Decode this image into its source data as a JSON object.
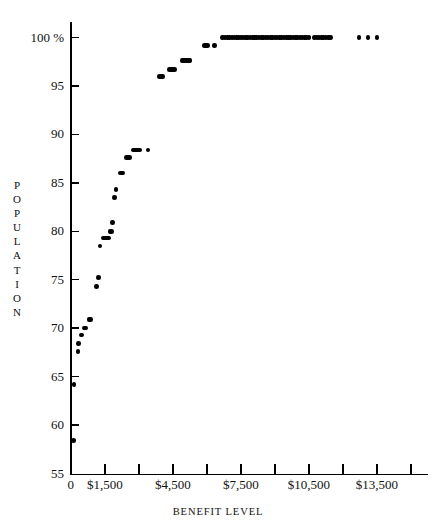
{
  "chart_data": {
    "type": "scatter",
    "title": "",
    "xlabel": "BENEFIT LEVEL",
    "ylabel": "POPULATION",
    "xlim": [
      0,
      15750
    ],
    "ylim": [
      55,
      101
    ],
    "grid": false,
    "legend": null,
    "x_tick_values": [
      0,
      1500,
      3000,
      4500,
      6000,
      7500,
      9000,
      10500,
      12000,
      13500,
      15000
    ],
    "x_tick_labels": [
      "0",
      "$1,500",
      "",
      "$4,500",
      "",
      "$7,500",
      "",
      "$10,500",
      "",
      "$13,500",
      ""
    ],
    "y_tick_values": [
      55,
      60,
      65,
      70,
      75,
      80,
      85,
      90,
      95,
      100
    ],
    "y_tick_labels": [
      "55",
      "60",
      "65",
      "70",
      "75",
      "80",
      "85",
      "90",
      "95",
      "100 %"
    ],
    "points": [
      {
        "x": 110,
        "y": 58.4
      },
      {
        "x": 140,
        "y": 64.2
      },
      {
        "x": 320,
        "y": 67.6
      },
      {
        "x": 330,
        "y": 68.4
      },
      {
        "x": 480,
        "y": 69.3
      },
      {
        "x": 600,
        "y": 70.0
      },
      {
        "x": 660,
        "y": 70.0
      },
      {
        "x": 800,
        "y": 70.9
      },
      {
        "x": 860,
        "y": 70.9
      },
      {
        "x": 1140,
        "y": 74.3
      },
      {
        "x": 1210,
        "y": 75.2
      },
      {
        "x": 1280,
        "y": 78.5
      },
      {
        "x": 1440,
        "y": 79.3
      },
      {
        "x": 1510,
        "y": 79.3
      },
      {
        "x": 1580,
        "y": 79.3
      },
      {
        "x": 1650,
        "y": 79.3
      },
      {
        "x": 1720,
        "y": 80.0
      },
      {
        "x": 1790,
        "y": 80.0
      },
      {
        "x": 1850,
        "y": 80.9
      },
      {
        "x": 1920,
        "y": 83.5
      },
      {
        "x": 1990,
        "y": 84.3
      },
      {
        "x": 2180,
        "y": 86.0
      },
      {
        "x": 2290,
        "y": 86.0
      },
      {
        "x": 2450,
        "y": 87.6
      },
      {
        "x": 2520,
        "y": 87.6
      },
      {
        "x": 2590,
        "y": 87.6
      },
      {
        "x": 2760,
        "y": 88.4
      },
      {
        "x": 2830,
        "y": 88.4
      },
      {
        "x": 2900,
        "y": 88.4
      },
      {
        "x": 2970,
        "y": 88.4
      },
      {
        "x": 3040,
        "y": 88.4
      },
      {
        "x": 3400,
        "y": 88.4
      },
      {
        "x": 3900,
        "y": 96.0
      },
      {
        "x": 3970,
        "y": 96.0
      },
      {
        "x": 4040,
        "y": 96.0
      },
      {
        "x": 4350,
        "y": 96.7
      },
      {
        "x": 4420,
        "y": 96.7
      },
      {
        "x": 4490,
        "y": 96.7
      },
      {
        "x": 4560,
        "y": 96.7
      },
      {
        "x": 4900,
        "y": 97.6
      },
      {
        "x": 4970,
        "y": 97.6
      },
      {
        "x": 5040,
        "y": 97.6
      },
      {
        "x": 5110,
        "y": 97.6
      },
      {
        "x": 5180,
        "y": 97.6
      },
      {
        "x": 5250,
        "y": 97.6
      },
      {
        "x": 5900,
        "y": 99.2
      },
      {
        "x": 5970,
        "y": 99.2
      },
      {
        "x": 6040,
        "y": 99.2
      },
      {
        "x": 6340,
        "y": 99.2
      },
      {
        "x": 6700,
        "y": 100.0
      },
      {
        "x": 6800,
        "y": 100.0
      },
      {
        "x": 6900,
        "y": 100.0
      },
      {
        "x": 7000,
        "y": 100.0
      },
      {
        "x": 7100,
        "y": 100.0
      },
      {
        "x": 7200,
        "y": 100.0
      },
      {
        "x": 7300,
        "y": 100.0
      },
      {
        "x": 7400,
        "y": 100.0
      },
      {
        "x": 7500,
        "y": 100.0
      },
      {
        "x": 7600,
        "y": 100.0
      },
      {
        "x": 7700,
        "y": 100.0
      },
      {
        "x": 7800,
        "y": 100.0
      },
      {
        "x": 7900,
        "y": 100.0
      },
      {
        "x": 8000,
        "y": 100.0
      },
      {
        "x": 8100,
        "y": 100.0
      },
      {
        "x": 8200,
        "y": 100.0
      },
      {
        "x": 8300,
        "y": 100.0
      },
      {
        "x": 8400,
        "y": 100.0
      },
      {
        "x": 8500,
        "y": 100.0
      },
      {
        "x": 8600,
        "y": 100.0
      },
      {
        "x": 8700,
        "y": 100.0
      },
      {
        "x": 8800,
        "y": 100.0
      },
      {
        "x": 8900,
        "y": 100.0
      },
      {
        "x": 9000,
        "y": 100.0
      },
      {
        "x": 9100,
        "y": 100.0
      },
      {
        "x": 9200,
        "y": 100.0
      },
      {
        "x": 9300,
        "y": 100.0
      },
      {
        "x": 9400,
        "y": 100.0
      },
      {
        "x": 9500,
        "y": 100.0
      },
      {
        "x": 9600,
        "y": 100.0
      },
      {
        "x": 9700,
        "y": 100.0
      },
      {
        "x": 9800,
        "y": 100.0
      },
      {
        "x": 9900,
        "y": 100.0
      },
      {
        "x": 10000,
        "y": 100.0
      },
      {
        "x": 10100,
        "y": 100.0
      },
      {
        "x": 10200,
        "y": 100.0
      },
      {
        "x": 10300,
        "y": 100.0
      },
      {
        "x": 10400,
        "y": 100.0
      },
      {
        "x": 10500,
        "y": 100.0
      },
      {
        "x": 10750,
        "y": 100.0
      },
      {
        "x": 10850,
        "y": 100.0
      },
      {
        "x": 10950,
        "y": 100.0
      },
      {
        "x": 11050,
        "y": 100.0
      },
      {
        "x": 11150,
        "y": 100.0
      },
      {
        "x": 11250,
        "y": 100.0
      },
      {
        "x": 11350,
        "y": 100.0
      },
      {
        "x": 11450,
        "y": 100.0
      },
      {
        "x": 12700,
        "y": 100.0
      },
      {
        "x": 13100,
        "y": 100.0
      },
      {
        "x": 13500,
        "y": 100.0
      }
    ]
  },
  "axes": {
    "y_title_letters": [
      "P",
      "O",
      "P",
      "U",
      "L",
      "A",
      "T",
      "I",
      "O",
      "N"
    ],
    "x_title": "BENEFIT LEVEL"
  }
}
